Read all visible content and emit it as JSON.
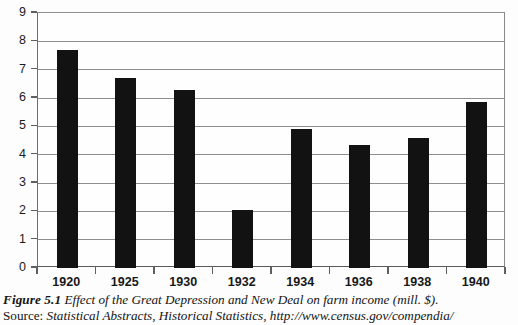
{
  "figure": {
    "label": "Figure 5.1",
    "caption": "Effect of the Great Depression and New Deal on farm income (mill. $).",
    "source_label": "Source:",
    "source_text": "Statistical Abstracts, Historical Statistics, http://www.census.gov/compendia/"
  },
  "chart_data": {
    "type": "bar",
    "title": "Effect of the Great Depression and New Deal on farm income (mill. $).",
    "xlabel": "",
    "ylabel": "",
    "categories": [
      "1920",
      "1925",
      "1930",
      "1932",
      "1934",
      "1936",
      "1938",
      "1940"
    ],
    "values": [
      7.7,
      6.7,
      6.3,
      2.05,
      4.9,
      4.35,
      4.6,
      5.85
    ],
    "ylim": [
      0,
      9
    ],
    "ytick_labels": [
      "0",
      "1",
      "2",
      "3",
      "4",
      "5",
      "6",
      "7",
      "8",
      "9"
    ],
    "ytick_values": [
      0,
      1,
      2,
      3,
      4,
      5,
      6,
      7,
      8,
      9
    ],
    "grid": true,
    "legend": false,
    "bar_color": "#121212",
    "axis_color": "#5f5f5f",
    "grid_color": "#8e8e8e",
    "units": "mill. $"
  }
}
